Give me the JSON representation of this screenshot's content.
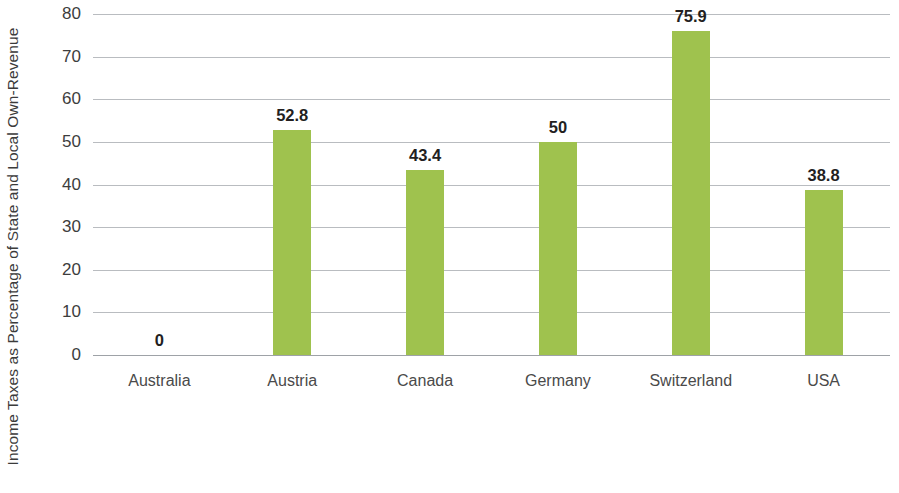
{
  "chart_data": {
    "type": "bar",
    "title": "",
    "subtitle": "",
    "xlabel": "",
    "ylabel": "Income Taxes as Percentage of State and Local Own-Revenue",
    "categories": [
      "Australia",
      "Austria",
      "Canada",
      "Germany",
      "Switzerland",
      "USA"
    ],
    "values": [
      0,
      52.8,
      43.4,
      50,
      75.9,
      38.8
    ],
    "data_labels": [
      "0",
      "52.8",
      "43.4",
      "50",
      "75.9",
      "38.8"
    ],
    "ylim": [
      0,
      80
    ],
    "ytick_step": 10,
    "ytick_labels": [
      "0",
      "10",
      "20",
      "30",
      "40",
      "50",
      "60",
      "70",
      "80"
    ],
    "grid": true,
    "grid_axis": "y",
    "legend": false,
    "legend_position": "none",
    "series": [
      {
        "name": "Income Taxes as Percentage of State and Local Own-Revenue",
        "values": [
          0,
          52.8,
          43.4,
          50,
          75.9,
          38.8
        ],
        "color": "#9FC24E"
      }
    ],
    "colors": {
      "bar": "#9FC24E",
      "gridline": "#B9BCC0",
      "axis": "#9EA2A7",
      "data_label_text": "#231F1F",
      "tick_text": "#3D3D3D",
      "category_text": "#4A4A4A",
      "axis_title_text": "#3B3B3B",
      "background": "#FFFFFF"
    }
  }
}
